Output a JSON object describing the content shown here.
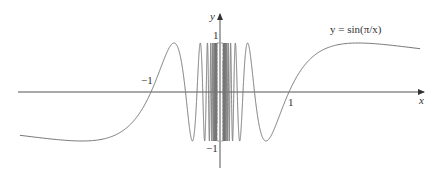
{
  "chart_data": {
    "type": "line",
    "title": "",
    "function_label": "y = sin(π/x)",
    "xlabel": "x",
    "ylabel": "y",
    "xlim": [
      -2.9,
      2.9
    ],
    "ylim": [
      -1,
      1
    ],
    "x_ticks": [
      {
        "value": -1,
        "label": "−1"
      },
      {
        "value": 1,
        "label": "1"
      }
    ],
    "y_ticks": [
      {
        "value": 1,
        "label": "1"
      },
      {
        "value": -1,
        "label": "−1"
      }
    ],
    "series": [
      {
        "name": "sin(π/x)",
        "function": "sin(pi/x)",
        "x_range": [
          -2.9,
          2.9
        ],
        "excluded": [
          0
        ]
      }
    ],
    "grid": false,
    "legend": "none",
    "color": "#777777"
  }
}
